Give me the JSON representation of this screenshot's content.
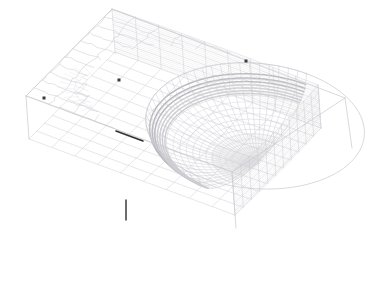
{
  "scene": {
    "title": "Finite element mesh of a block with a hemispherical cut-out",
    "background_color": "#ffffff",
    "render_mode": "wireframe",
    "width": 386,
    "height": 283
  },
  "style": {
    "mesh_line_color": "#c9c9cf",
    "mesh_line_color_faint": "#dedee3",
    "mesh_line_color_dense": "#d4d4da",
    "shaded_band_color": "#b8b8be",
    "shaded_band_color_light": "#cfcfd4",
    "marker_color": "#3a3a3a",
    "highlight_edge_color": "#2f2f2f",
    "line_width_main": 0.5,
    "line_width_fine": 0.35
  },
  "geometry": {
    "block": {
      "name": "rectangular-block",
      "corners_2d": {
        "top_back": [
          112,
          9
        ],
        "top_right": [
          345,
          98
        ],
        "top_front": [
          232,
          172
        ],
        "top_left": [
          26,
          96
        ],
        "bottom_right": [
          352,
          148
        ],
        "bottom_front": [
          236,
          228
        ],
        "bottom_left": [
          29,
          139
        ]
      },
      "top_face_grid": {
        "u_divisions": 11,
        "v_divisions": 9
      },
      "side_face_layers": 22
    },
    "cutout": {
      "name": "hemispherical-cavity",
      "center_2d": [
        141,
        140
      ],
      "radius_x": 115,
      "radius_y": 95,
      "radial_rings": 17,
      "angular_spokes": 34,
      "orientation": "opens-downward-front"
    },
    "refinement_patches": [
      {
        "name": "refined-patch-left",
        "center_2d": [
          112,
          82
        ],
        "radius": 42,
        "levels": 4
      },
      {
        "name": "refined-patch-right",
        "center_2d": [
          222,
          132
        ],
        "radius": 38,
        "levels": 4
      }
    ]
  },
  "markers": [
    {
      "name": "node-marker-left-edge",
      "x": 44,
      "y": 98,
      "size": 3
    },
    {
      "name": "node-marker-top-left",
      "x": 119,
      "y": 80,
      "size": 3
    },
    {
      "name": "node-marker-top-right",
      "x": 246,
      "y": 61,
      "size": 3
    }
  ],
  "highlight_edges": [
    {
      "name": "cut-edge-highlight",
      "x1": 116,
      "y1": 131,
      "x2": 143,
      "y2": 141,
      "width": 1.6
    },
    {
      "name": "crack-line-highlight",
      "x1": 126,
      "y1": 200,
      "x2": 126,
      "y2": 220,
      "width": 1.4
    }
  ]
}
